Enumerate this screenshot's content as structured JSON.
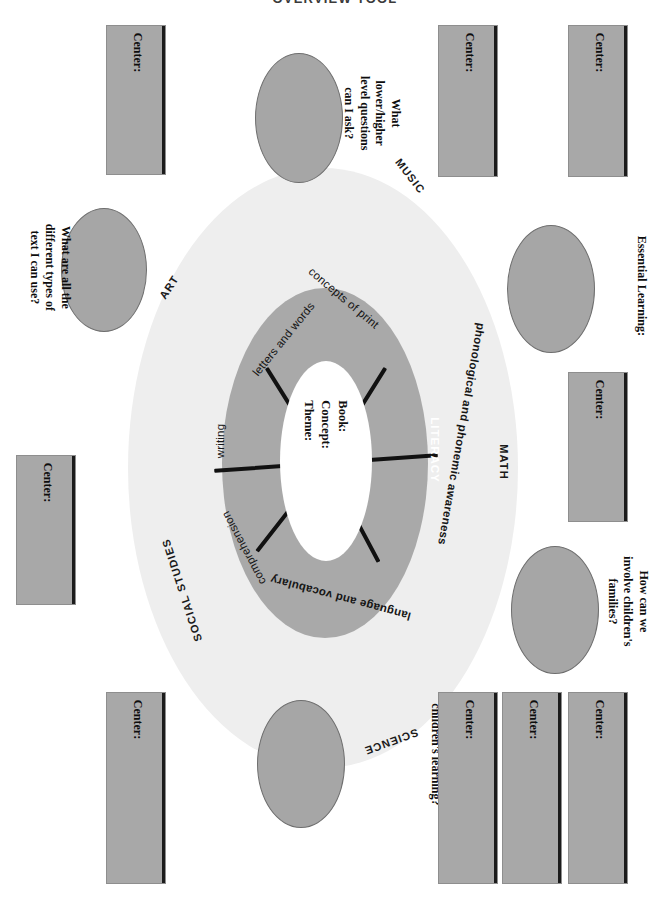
{
  "page": {
    "title": "OVERVIEW TOOL",
    "orientation": "rotated-90"
  },
  "wheel": {
    "center": {
      "line1": "Book:",
      "line2": "Concept:",
      "line3": "Theme:"
    },
    "literacy_ring_label": "LITERACY",
    "ring_segments": [
      {
        "id": "concepts-of-print",
        "label": "concepts of print"
      },
      {
        "id": "phonological-phonemic",
        "label": "phonological and phonemic awareness"
      },
      {
        "id": "language-vocabulary",
        "label": "language and vocabulary"
      },
      {
        "id": "comprehension",
        "label": "comprehension"
      },
      {
        "id": "writing",
        "label": "writing"
      },
      {
        "id": "letters-and-words",
        "label": "letters and words"
      }
    ],
    "subject_areas": [
      {
        "id": "music",
        "label": "MUSIC"
      },
      {
        "id": "math",
        "label": "MATH"
      },
      {
        "id": "science",
        "label": "SCIENCE"
      },
      {
        "id": "social-studies",
        "label": "SOCIAL STUDIES"
      },
      {
        "id": "art",
        "label": "ART"
      }
    ]
  },
  "ovals": [
    {
      "id": "questions",
      "text": "What\nlower/higher\nlevel questions\ncan I ask?"
    },
    {
      "id": "text-types",
      "text": "What are all the\ndifferent types of\ntext I can use?"
    },
    {
      "id": "essential-learning",
      "text": "Essential Learning:"
    },
    {
      "id": "families",
      "text": "How can we\ninvolve children's\nfamilies?"
    },
    {
      "id": "observe-document",
      "text": "What should I observe\nand document about\nchildren's learning?"
    }
  ],
  "center_boxes": [
    {
      "id": "center-box-1",
      "label": "Center:"
    },
    {
      "id": "center-box-2",
      "label": "Center:"
    },
    {
      "id": "center-box-3",
      "label": "Center:"
    },
    {
      "id": "center-box-4",
      "label": "Center:"
    },
    {
      "id": "center-box-5",
      "label": "Center:"
    },
    {
      "id": "center-box-6",
      "label": "Center:"
    },
    {
      "id": "center-box-7",
      "label": "Center:"
    },
    {
      "id": "center-box-8",
      "label": "Center:"
    },
    {
      "id": "center-box-9",
      "label": "Center:"
    }
  ],
  "colors": {
    "outer_circle": "#eeeeee",
    "mid_ring": "#a9a9a9",
    "inner_hole": "#ffffff",
    "oval_fill": "#a6a6a6",
    "box_fill": "#a8a8a8",
    "spoke": "#111111"
  }
}
